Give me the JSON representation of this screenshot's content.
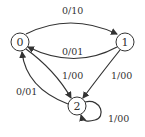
{
  "diagram": {
    "type": "state-diagram",
    "nodes": [
      {
        "id": "0",
        "label": "0"
      },
      {
        "id": "1",
        "label": "1"
      },
      {
        "id": "2",
        "label": "2"
      }
    ],
    "edges": [
      {
        "from": "0",
        "to": "1",
        "label": "0/10"
      },
      {
        "from": "1",
        "to": "0",
        "label": "0/01"
      },
      {
        "from": "0",
        "to": "2",
        "label": "1/00"
      },
      {
        "from": "1",
        "to": "2",
        "label": "1/00"
      },
      {
        "from": "2",
        "to": "0",
        "label": "0/01"
      },
      {
        "from": "2",
        "to": "2",
        "label": "1/00"
      }
    ],
    "colors": {
      "stroke": "#333333",
      "background": "#ffffff"
    }
  }
}
